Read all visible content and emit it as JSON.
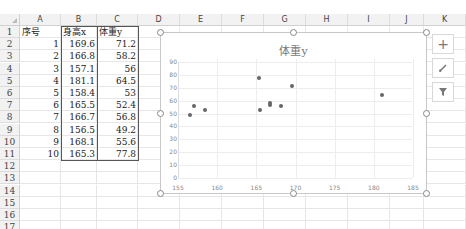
{
  "sheet": {
    "columns": [
      "A",
      "B",
      "C",
      "D",
      "E",
      "F",
      "G",
      "H",
      "I",
      "J",
      "K",
      "L"
    ],
    "rows": [
      "1",
      "2",
      "3",
      "4",
      "5",
      "6",
      "7",
      "8",
      "9",
      "10",
      "11",
      "12",
      "13",
      "14",
      "15",
      "16",
      "17"
    ],
    "headers": {
      "A": "序号",
      "B": "身高x",
      "C": "体重y"
    },
    "data": [
      {
        "id": "1",
        "x": "169.6",
        "y": "71.2"
      },
      {
        "id": "2",
        "x": "166.8",
        "y": "58.2"
      },
      {
        "id": "3",
        "x": "157.1",
        "y": "56"
      },
      {
        "id": "4",
        "x": "181.1",
        "y": "64.5"
      },
      {
        "id": "5",
        "x": "158.4",
        "y": "53"
      },
      {
        "id": "6",
        "x": "165.5",
        "y": "52.4"
      },
      {
        "id": "7",
        "x": "166.7",
        "y": "56.8"
      },
      {
        "id": "8",
        "x": "156.5",
        "y": "49.2"
      },
      {
        "id": "9",
        "x": "168.1",
        "y": "55.6"
      },
      {
        "id": "10",
        "x": "165.3",
        "y": "77.8"
      }
    ]
  },
  "chart": {
    "title": "体重y",
    "y_ticks": [
      "90",
      "80",
      "70",
      "60",
      "50",
      "40",
      "30",
      "20",
      "10",
      "0"
    ],
    "x_ticks": [
      "155",
      "160",
      "165",
      "170",
      "175",
      "180",
      "185"
    ]
  },
  "chart_data": {
    "type": "scatter",
    "title": "体重y",
    "xlabel": "",
    "ylabel": "",
    "xlim": [
      155,
      185
    ],
    "ylim": [
      0,
      90
    ],
    "grid": true,
    "legend": "none",
    "x": [
      169.6,
      166.8,
      157.1,
      181.1,
      158.4,
      165.5,
      166.7,
      156.5,
      168.1,
      165.3
    ],
    "y": [
      71.2,
      58.2,
      56,
      64.5,
      53,
      52.4,
      56.8,
      49.2,
      55.6,
      77.8
    ]
  },
  "side_buttons": {
    "add": "chart-elements",
    "style": "chart-styles",
    "filter": "chart-filters"
  }
}
